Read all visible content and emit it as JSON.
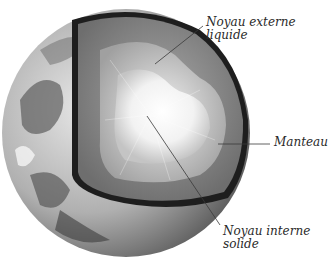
{
  "diagram": {
    "labels": {
      "outer_core": {
        "line1": "Noyau externe",
        "line2": "liquide"
      },
      "mantle": {
        "line1": "Manteau"
      },
      "inner_core": {
        "line1": "Noyau interne",
        "line2": "solide"
      }
    },
    "colors": {
      "background": "#ffffff",
      "text": "#2a2a2a",
      "leader_line": "#3a3a3a",
      "crust_dark": "#1e1e1e",
      "mantle": "#8a8a8a",
      "outer_core": "#c8c8c8",
      "inner_core": "#f4f4f4"
    }
  }
}
